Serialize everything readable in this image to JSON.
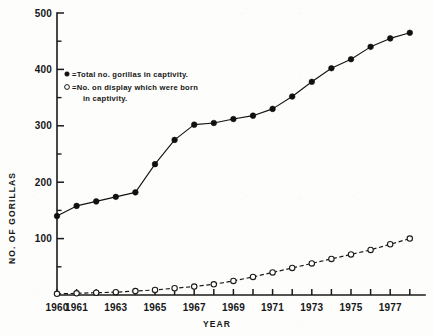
{
  "figure": {
    "background_color": "#fdfdfb",
    "ink_color": "#121212"
  },
  "axes": {
    "x_title": "YEAR",
    "y_title": "NO. OF GORILLAS",
    "y_tick_labels": [
      "100",
      "200",
      "300",
      "400",
      "500"
    ],
    "x_tick_labels": [
      "1960",
      "1961",
      "1963",
      "1965",
      "1967",
      "1969",
      "1971",
      "1973",
      "1975",
      "1977"
    ]
  },
  "legend": {
    "entry1_marker": "filled-circle",
    "entry1_text": "=Total no. gorillas in captivity.",
    "entry2_marker": "open-circle",
    "entry2_text": "=No. on display which  were  born",
    "entry2_text_line2": "in captivity."
  },
  "chart_data": {
    "type": "line",
    "title": "",
    "subtitle": "",
    "xlabel": "YEAR",
    "ylabel": "NO. OF GORILLAS",
    "xlim": [
      1960,
      1978.6
    ],
    "ylim": [
      0,
      500
    ],
    "grid": false,
    "legend_position": "upper-left-inside",
    "x": [
      1960,
      1961,
      1962,
      1963,
      1964,
      1965,
      1966,
      1967,
      1968,
      1969,
      1970,
      1971,
      1972,
      1973,
      1974,
      1975,
      1976,
      1977,
      1978
    ],
    "series": [
      {
        "name": "Total no. gorillas in captivity.",
        "marker": "filled-circle",
        "line_style": "solid",
        "values": [
          140,
          158,
          166,
          174,
          182,
          232,
          275,
          302,
          305,
          312,
          318,
          330,
          352,
          378,
          402,
          418,
          440,
          455,
          465
        ]
      },
      {
        "name": "No. on display which were born in captivity.",
        "marker": "open-circle",
        "line_style": "dashed",
        "values": [
          2,
          3,
          4,
          5,
          7,
          9,
          12,
          15,
          19,
          25,
          32,
          40,
          48,
          56,
          64,
          72,
          80,
          90,
          100
        ]
      }
    ],
    "x_tick_values": [
      1960,
      1961,
      1963,
      1965,
      1967,
      1969,
      1971,
      1973,
      1975,
      1977
    ],
    "y_tick_values": [
      100,
      200,
      300,
      400,
      500
    ],
    "y_minor_tick_values": [
      50,
      150,
      250,
      350,
      450
    ]
  }
}
